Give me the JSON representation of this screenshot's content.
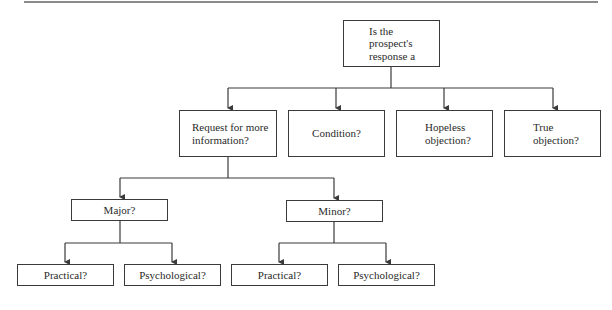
{
  "diagram": {
    "type": "decision-tree",
    "root": {
      "id": "root",
      "label": "Is the\nprospect's\nresponse a"
    },
    "level1": [
      {
        "id": "request-info",
        "label": "Request for more\ninformation?"
      },
      {
        "id": "condition",
        "label": "Condition?"
      },
      {
        "id": "hopeless",
        "label": "Hopeless\nobjection?"
      },
      {
        "id": "true-objection",
        "label": "True\nobjection?"
      }
    ],
    "level2": [
      {
        "id": "major",
        "parent": "request-info",
        "label": "Major?"
      },
      {
        "id": "minor",
        "parent": "request-info",
        "label": "Minor?"
      }
    ],
    "level3": [
      {
        "id": "major-practical",
        "parent": "major",
        "label": "Practical?"
      },
      {
        "id": "major-psychological",
        "parent": "major",
        "label": "Psychological?"
      },
      {
        "id": "minor-practical",
        "parent": "minor",
        "label": "Practical?"
      },
      {
        "id": "minor-psychological",
        "parent": "minor",
        "label": "Psychological?"
      }
    ],
    "edges": [
      [
        "root",
        "request-info"
      ],
      [
        "root",
        "condition"
      ],
      [
        "root",
        "hopeless"
      ],
      [
        "root",
        "true-objection"
      ],
      [
        "request-info",
        "major"
      ],
      [
        "request-info",
        "minor"
      ],
      [
        "major",
        "major-practical"
      ],
      [
        "major",
        "major-psychological"
      ],
      [
        "minor",
        "minor-practical"
      ],
      [
        "minor",
        "minor-psychological"
      ]
    ],
    "colors": {
      "line": "#3a3a3a",
      "box_border": "#3a3a3a",
      "text": "#2a2a2a",
      "top_rule": "#8a8a8a",
      "background": "#ffffff"
    }
  }
}
